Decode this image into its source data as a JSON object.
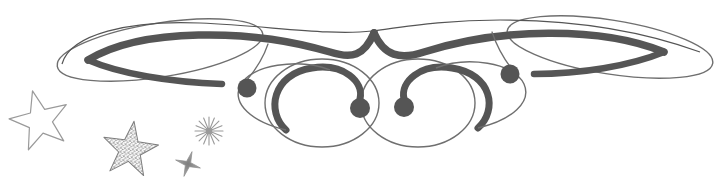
{
  "document": {
    "title": "Decorative Calligraphic Flourish with Stars",
    "type": "ornament-illustration",
    "width": 726,
    "height": 194,
    "background_color": "#ffffff"
  },
  "palette": {
    "ink_dark": "#555555",
    "ink_mid": "#6b6b6b",
    "ink_light": "#8a8a8a",
    "ink_faint": "#a9a9a9",
    "star_outline": "#9a9a9a",
    "star_speckle": "#7d7d7d",
    "background": "#ffffff"
  },
  "flourish": {
    "name": "central-calligraphic-swash",
    "description": "Symmetric pen-drawn flourish with two outer thin ellipse wings, two thick tapered swashes crossing at top center, two large thin circles below, inward spirals ending in filled dots",
    "stroke_color": "#555555",
    "thin_stroke_color": "#6f6f6f",
    "thick_stroke_width": 7,
    "thin_stroke_width": 1.3,
    "bounds": {
      "x": 55,
      "y": 12,
      "width": 660,
      "height": 135
    },
    "elements": [
      {
        "name": "left-wing-ellipse",
        "type": "ellipse-thin",
        "cx": 160,
        "cy": 50,
        "rx": 104,
        "ry": 27,
        "rotation": -9
      },
      {
        "name": "right-wing-ellipse",
        "type": "ellipse-thin",
        "cx": 610,
        "cy": 47,
        "rx": 104,
        "ry": 27,
        "rotation": 9
      },
      {
        "name": "left-thick-swash",
        "type": "tapered-swash",
        "from": "left-wing",
        "to": "top-center-crossing"
      },
      {
        "name": "right-thick-swash",
        "type": "tapered-swash",
        "from": "right-wing",
        "to": "top-center-crossing"
      },
      {
        "name": "top-center-crossing",
        "type": "crossing-point",
        "x": 372,
        "y": 31
      },
      {
        "name": "left-lower-circle",
        "type": "circle-thin",
        "cx": 322,
        "cy": 103,
        "rx": 57,
        "ry": 44
      },
      {
        "name": "right-lower-circle",
        "type": "circle-thin",
        "cx": 418,
        "cy": 103,
        "rx": 57,
        "ry": 44
      },
      {
        "name": "left-inner-spiral",
        "type": "spiral-thick",
        "terminates_at": "left-inner-dot"
      },
      {
        "name": "right-inner-spiral",
        "type": "spiral-thick",
        "terminates_at": "right-inner-dot"
      },
      {
        "name": "left-outer-tail",
        "type": "hairline-tail",
        "terminates_at": "left-outer-dot"
      },
      {
        "name": "right-outer-tail",
        "type": "hairline-tail",
        "terminates_at": "right-outer-dot"
      }
    ],
    "dots": [
      {
        "name": "left-outer-dot",
        "cx": 247,
        "cy": 88,
        "r": 9.5,
        "fill": "#555555"
      },
      {
        "name": "left-inner-dot",
        "cx": 360,
        "cy": 108,
        "r": 10,
        "fill": "#555555"
      },
      {
        "name": "right-inner-dot",
        "cx": 404,
        "cy": 107,
        "r": 10,
        "fill": "#555555"
      },
      {
        "name": "right-outer-dot",
        "cx": 510,
        "cy": 74,
        "r": 9.5,
        "fill": "#555555"
      }
    ]
  },
  "stars": [
    {
      "name": "large-outline-star",
      "style": "hand-drawn thin outline, unfilled",
      "points": 5,
      "cx": 40,
      "cy": 121,
      "outer_radius": 31,
      "inner_radius": 12.5,
      "rotation": -14,
      "stroke_color": "#9a9a9a",
      "stroke_width": 1.2,
      "fill": "none"
    },
    {
      "name": "speckled-filled-star",
      "style": "stippled speckled fill, textured",
      "points": 5,
      "cx": 130,
      "cy": 150,
      "outer_radius": 29,
      "inner_radius": 11.5,
      "rotation": 8,
      "stroke_color": "#7d7d7d",
      "fill_color": "#8d8d8d",
      "texture": "speckle"
    },
    {
      "name": "small-four-point-sparkle",
      "style": "four-point sparkle, soft fill",
      "points": 4,
      "cx": 188,
      "cy": 164,
      "outer_radius": 13,
      "inner_radius": 3,
      "rotation": 18,
      "stroke_color": "#8f8f8f",
      "fill_color": "#9b9b9b"
    },
    {
      "name": "radiating-burst-sparkle",
      "style": "eight radiating rays around small core",
      "rays": 8,
      "cx": 209,
      "cy": 131,
      "outer_radius": 14,
      "core_radius": 3.2,
      "stroke_color": "#9a9a9a",
      "stroke_width": 1.1
    }
  ]
}
